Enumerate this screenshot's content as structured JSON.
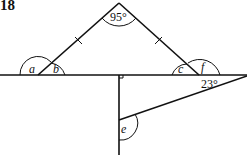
{
  "question_number": "18",
  "angles": {
    "apex": "95°",
    "a": "a",
    "b": "b",
    "c": "c",
    "f": "f",
    "e": "e",
    "given_right": "23°"
  },
  "marks": {
    "equal_sides": "tick marks on both slanted sides of the triangle (isosceles)",
    "right_angle": "square marker where vertical line meets horizontal line"
  },
  "colors": {
    "stroke": "#111111",
    "background": "#ffffff"
  }
}
